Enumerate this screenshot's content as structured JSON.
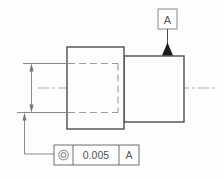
{
  "drawing": {
    "type": "gdt-engineering-drawing",
    "description": "Side view of a stepped cylinder with datum feature symbol and concentricity feature control frame",
    "datum_flag": {
      "label": "A"
    },
    "feature_control_frame": {
      "symbol": "concentricity",
      "tolerance": "0.005",
      "datum_ref": "A"
    },
    "dimension": {
      "style": "vertical-double-arrow",
      "value_shown": ""
    }
  },
  "colors": {
    "object_line": "#4d4d4d",
    "thin_line": "#8a8a8a",
    "hidden_line": "#9c9c9c",
    "center_line": "#aaaaaa",
    "frame_line": "#6e6e6e",
    "text": "#555555",
    "datum_triangle_fill": "#1c1c1c",
    "background": "#fefefe"
  }
}
